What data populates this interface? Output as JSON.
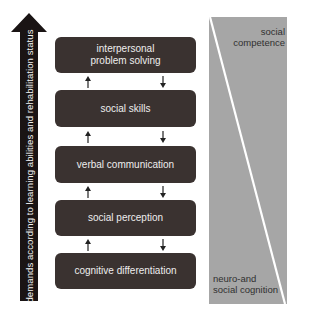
{
  "diagram": {
    "vertical_arrow": {
      "label": "demands according to learning abilities and rehabilitation status",
      "direction": "up",
      "color": "#1a1414"
    },
    "levels": [
      {
        "label_lines": [
          "interpersonal",
          "problem solving"
        ],
        "label": "interpersonal problem solving"
      },
      {
        "label": "social skills"
      },
      {
        "label": "verbal communication"
      },
      {
        "label": "social perception"
      },
      {
        "label": "cognitive differentiation"
      }
    ],
    "connectors": "each adjacent pair linked by an upward arrow (left) and a downward arrow (right)",
    "box_color": "#3a3230",
    "panel": {
      "color": "#a6a6a6",
      "divider_color": "#ffffff",
      "top_label_lines": [
        "social",
        "competence"
      ],
      "top_label": "social competence",
      "bottom_label_lines": [
        "neuro-and",
        "social cognition"
      ],
      "bottom_label": "neuro-and social cognition"
    }
  }
}
